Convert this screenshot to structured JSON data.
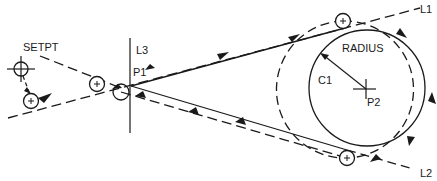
{
  "diagram": {
    "type": "tool-path-tangent-circle",
    "labels": {
      "setpt": "SETPT",
      "l1": "L1",
      "l2": "L2",
      "l3": "L3",
      "p1": "P1",
      "p2": "P2",
      "c1": "C1",
      "radius": "RADIUS"
    },
    "colors": {
      "line": "#1a1a1a",
      "background": "#ffffff"
    },
    "elements": [
      {
        "id": "setpt",
        "kind": "crosshair-circle",
        "label": "SETPT"
      },
      {
        "id": "l1",
        "kind": "line",
        "label": "L1"
      },
      {
        "id": "l2",
        "kind": "line",
        "label": "L2"
      },
      {
        "id": "l3",
        "kind": "line",
        "label": "L3"
      },
      {
        "id": "p1",
        "kind": "point",
        "label": "P1"
      },
      {
        "id": "p2",
        "kind": "point",
        "label": "P2"
      },
      {
        "id": "c1",
        "kind": "circle",
        "label": "C1"
      },
      {
        "id": "radius",
        "kind": "dimension",
        "label": "RADIUS"
      },
      {
        "id": "tool-path",
        "kind": "dashed-path-with-arrows"
      },
      {
        "id": "tool-positions",
        "kind": "tool-circles",
        "count": 5
      }
    ]
  }
}
